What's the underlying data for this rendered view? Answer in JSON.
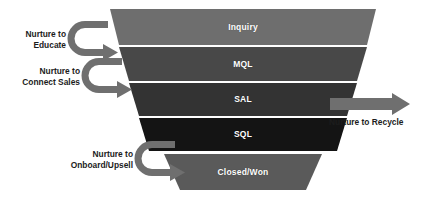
{
  "diagram": {
    "type": "sales-funnel",
    "background_color": "#ffffff",
    "stage_label_color": "#ffffff",
    "side_label_color": "#1c1c1c",
    "arrow_color": "#6f6f6f"
  },
  "funnel": {
    "stages": [
      {
        "id": "inquiry",
        "label": "Inquiry",
        "color": "#6e6e6e",
        "order": 1
      },
      {
        "id": "mql",
        "label": "MQL",
        "color": "#484848",
        "order": 2
      },
      {
        "id": "sal",
        "label": "SAL",
        "color": "#333333",
        "order": 3
      },
      {
        "id": "sql",
        "label": "SQL",
        "color": "#141414",
        "order": 4
      },
      {
        "id": "closed-won",
        "label": "Closed/Won",
        "color": "#5a5a5a",
        "order": 5
      }
    ]
  },
  "nurture_paths": {
    "left": [
      {
        "id": "educate",
        "lines": [
          "Nurture to",
          "Educate"
        ],
        "target_stage": "mql",
        "arrow": "u-turn-right"
      },
      {
        "id": "connect-sales",
        "lines": [
          "Nurture to",
          "Connect Sales"
        ],
        "target_stage": "sal",
        "arrow": "u-turn-right"
      },
      {
        "id": "onboard-upsell",
        "lines": [
          "Nurture to",
          "Onboard/Upsell"
        ],
        "target_stage": "closed-won",
        "arrow": "u-turn-right"
      }
    ],
    "right": [
      {
        "id": "recycle",
        "lines": [
          "Nurture to Recycle"
        ],
        "source_stage": "sal",
        "arrow": "straight-right"
      }
    ]
  }
}
